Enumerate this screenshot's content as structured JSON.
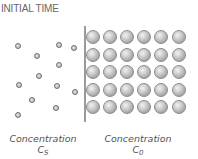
{
  "title": "INITIAL TIME",
  "colors": {
    "title": "#666666",
    "divider": "#9a9a9a",
    "dot_ring": "#6e6e6e",
    "ball_rim": "#858585",
    "label": "#555555"
  },
  "left_region": {
    "label_word": "Concentration",
    "symbol": "C",
    "subscript": "S",
    "particles": [
      {
        "x": 18,
        "y": 46
      },
      {
        "x": 59,
        "y": 45
      },
      {
        "x": 74,
        "y": 48
      },
      {
        "x": 37,
        "y": 56
      },
      {
        "x": 59,
        "y": 65
      },
      {
        "x": 39,
        "y": 76
      },
      {
        "x": 19,
        "y": 85
      },
      {
        "x": 57,
        "y": 86
      },
      {
        "x": 75,
        "y": 92
      },
      {
        "x": 32,
        "y": 100
      },
      {
        "x": 56,
        "y": 108
      },
      {
        "x": 18,
        "y": 115
      }
    ]
  },
  "right_region": {
    "label_word": "Concentration",
    "symbol": "C",
    "subscript": "0",
    "grid": {
      "columns": [
        93,
        110,
        127,
        144,
        161,
        179
      ],
      "rows": [
        37,
        55,
        72,
        90,
        107
      ]
    }
  }
}
